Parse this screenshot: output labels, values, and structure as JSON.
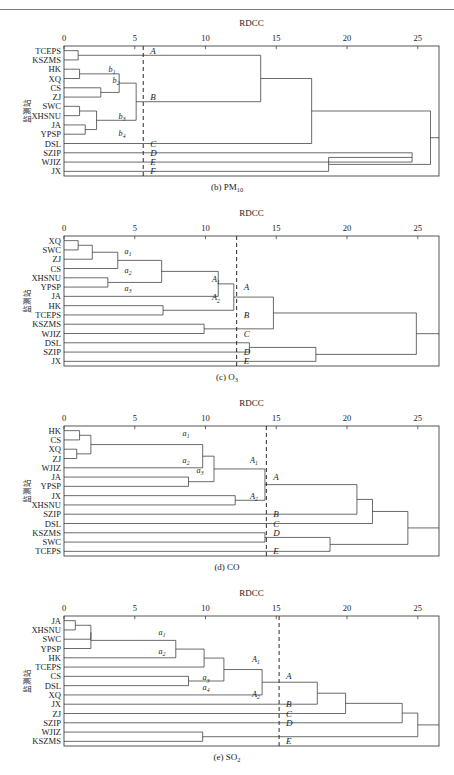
{
  "figure": {
    "axis_title": "RDCC",
    "y_axis_label": "监测站",
    "tick_labels": [
      "0",
      "5",
      "10",
      "15",
      "20",
      "25"
    ],
    "tick_values": [
      0,
      5,
      10,
      15,
      20,
      25
    ],
    "axis_range": [
      0,
      26.5
    ]
  },
  "chart_data": {
    "type": "dendrogram",
    "title": "",
    "xlabel": "RDCC",
    "ylabel": "监测站",
    "xlim": [
      0,
      26.5
    ],
    "grid": false,
    "legend": "none",
    "panels": [
      {
        "id": "b",
        "caption_prefix": "(b) PM",
        "caption_sub": "10",
        "caption_full": "(b) PM10",
        "leaves": [
          "TCEPS",
          "KSZMS",
          "HK",
          "XQ",
          "CS",
          "ZJ",
          "SWC",
          "XHSNU",
          "JA",
          "YPSP",
          "DSL",
          "SZIP",
          "WJIZ",
          "JX"
        ],
        "cut_value": 5.6,
        "cluster_labels": [
          "A",
          "B",
          "C",
          "D",
          "E",
          "F"
        ],
        "sub_labels": [
          "b1",
          "b2",
          "b3",
          "b4"
        ],
        "merges": [
          {
            "left": 0,
            "right": 1,
            "height": 1.0,
            "type": "leafleaf"
          },
          {
            "left": 2,
            "right": 3,
            "height": 1.1,
            "type": "leafleaf"
          },
          {
            "left": 6,
            "right": 7,
            "height": 1.1,
            "type": "leafleaf"
          },
          {
            "left": 8,
            "right": 9,
            "height": 1.5,
            "type": "leafleaf"
          },
          {
            "left": 4,
            "right": 5,
            "height": 2.6,
            "type": "leafleaf"
          },
          {
            "left": 2,
            "right": 4,
            "height": 3.9,
            "type": "node"
          },
          {
            "left": 6,
            "right": 8,
            "height": 2.3,
            "type": "node"
          },
          {
            "left": 2,
            "right": 6,
            "height": 5.1,
            "type": "node"
          },
          {
            "left": 0,
            "right": 2,
            "height": 13.9,
            "type": "node"
          },
          {
            "left": 0,
            "right": 10,
            "height": 17.5,
            "type": "node"
          },
          {
            "left": 11,
            "right": 12,
            "height": 24.6,
            "type": "node"
          },
          {
            "left": 11,
            "right": 13,
            "height": 18.7,
            "type": "node"
          },
          {
            "left": 0,
            "right": 11,
            "height": 25.9,
            "type": "root"
          }
        ]
      },
      {
        "id": "c",
        "caption_prefix": "(c) O",
        "caption_sub": "3",
        "caption_full": "(c) O3",
        "leaves": [
          "XQ",
          "SWC",
          "ZJ",
          "CS",
          "XHSNU",
          "YPSP",
          "JA",
          "HK",
          "TCEPS",
          "KSZMS",
          "WJIZ",
          "DSL",
          "SZIP",
          "JX"
        ],
        "cut_value": 12.2,
        "cluster_labels": [
          "A",
          "B",
          "C",
          "D",
          "E"
        ],
        "sub_labels": [
          "a1",
          "a2",
          "a3",
          "A1",
          "A2"
        ],
        "merges": [
          {
            "left": 0,
            "right": 1,
            "height": 1.0,
            "type": "leafleaf"
          },
          {
            "left": 0,
            "right": 2,
            "height": 2.0,
            "type": "node"
          },
          {
            "left": 0,
            "right": 3,
            "height": 3.8,
            "type": "node"
          },
          {
            "left": 4,
            "right": 5,
            "height": 3.1,
            "type": "node"
          },
          {
            "left": 0,
            "right": 4,
            "height": 6.9,
            "type": "node"
          },
          {
            "left": 0,
            "right": 6,
            "height": 10.9,
            "type": "node"
          },
          {
            "left": 7,
            "right": 8,
            "height": 7.0,
            "type": "node"
          },
          {
            "left": 0,
            "right": 7,
            "height": 12.0,
            "type": "node"
          },
          {
            "left": 9,
            "right": 10,
            "height": 9.9,
            "type": "node"
          },
          {
            "left": 0,
            "right": 9,
            "height": 14.8,
            "type": "node"
          },
          {
            "left": 11,
            "right": 12,
            "height": 13.1,
            "type": "node"
          },
          {
            "left": 11,
            "right": 13,
            "height": 17.8,
            "type": "node"
          },
          {
            "left": 0,
            "right": 11,
            "height": 24.9,
            "type": "root"
          }
        ]
      },
      {
        "id": "d",
        "caption_prefix": "(d) CO",
        "caption_sub": "",
        "caption_full": "(d) CO",
        "leaves": [
          "HK",
          "CS",
          "XQ",
          "ZJ",
          "WJIZ",
          "JA",
          "YPSP",
          "JX",
          "XHSNU",
          "SZIP",
          "DSL",
          "KSZMS",
          "SWC",
          "TCEPS"
        ],
        "cut_value": 14.3,
        "cluster_labels": [
          "A",
          "B",
          "C",
          "D",
          "E"
        ],
        "sub_labels": [
          "a1",
          "a2",
          "a3",
          "A1",
          "A2"
        ],
        "merges": [
          {
            "left": 0,
            "right": 1,
            "height": 1.1,
            "type": "leafleaf"
          },
          {
            "left": 2,
            "right": 3,
            "height": 0.9,
            "type": "leafleaf"
          },
          {
            "left": 0,
            "right": 2,
            "height": 1.9,
            "type": "node"
          },
          {
            "left": 0,
            "right": 4,
            "height": 9.8,
            "type": "node"
          },
          {
            "left": 5,
            "right": 6,
            "height": 8.8,
            "type": "node"
          },
          {
            "left": 0,
            "right": 5,
            "height": 10.6,
            "type": "node"
          },
          {
            "left": 7,
            "right": 8,
            "height": 12.1,
            "type": "node"
          },
          {
            "left": 0,
            "right": 7,
            "height": 14.2,
            "type": "node"
          },
          {
            "left": 0,
            "right": 9,
            "height": 20.7,
            "type": "node"
          },
          {
            "left": 11,
            "right": 12,
            "height": 14.2,
            "type": "node"
          },
          {
            "left": 11,
            "right": 13,
            "height": 18.8,
            "type": "node"
          },
          {
            "left": 0,
            "right": 10,
            "height": 21.8,
            "type": "node"
          },
          {
            "left": 0,
            "right": 11,
            "height": 24.3,
            "type": "root"
          }
        ]
      },
      {
        "id": "e",
        "caption_prefix": "(e) SO",
        "caption_sub": "2",
        "caption_full": "(e) SO2",
        "leaves": [
          "JA",
          "XHSNU",
          "SWC",
          "YPSP",
          "HK",
          "TCEPS",
          "CS",
          "DSL",
          "XQ",
          "JX",
          "ZJ",
          "SZIP",
          "WJIZ",
          "KSZMS"
        ],
        "cut_value": 15.2,
        "cluster_labels": [
          "A",
          "B",
          "C",
          "D",
          "E"
        ],
        "sub_labels": [
          "a1",
          "a2",
          "a3",
          "a4",
          "A1",
          "A2"
        ],
        "merges": [
          {
            "left": 0,
            "right": 1,
            "height": 0.8,
            "type": "leafleaf"
          },
          {
            "left": 0,
            "right": 2,
            "height": 1.9,
            "type": "node"
          },
          {
            "left": 0,
            "right": 3,
            "height": 1.9,
            "type": "node"
          },
          {
            "left": 0,
            "right": 4,
            "height": 7.9,
            "type": "node"
          },
          {
            "left": 0,
            "right": 5,
            "height": 9.9,
            "type": "node"
          },
          {
            "left": 6,
            "right": 7,
            "height": 8.8,
            "type": "node"
          },
          {
            "left": 0,
            "right": 6,
            "height": 11.3,
            "type": "node"
          },
          {
            "left": 0,
            "right": 8,
            "height": 14.0,
            "type": "node"
          },
          {
            "left": 0,
            "right": 9,
            "height": 17.9,
            "type": "node"
          },
          {
            "left": 0,
            "right": 10,
            "height": 19.9,
            "type": "node"
          },
          {
            "left": 0,
            "right": 11,
            "height": 23.9,
            "type": "node"
          },
          {
            "left": 12,
            "right": 13,
            "height": 9.8,
            "type": "node"
          },
          {
            "left": 0,
            "right": 12,
            "height": 25.0,
            "type": "root"
          }
        ]
      }
    ]
  }
}
